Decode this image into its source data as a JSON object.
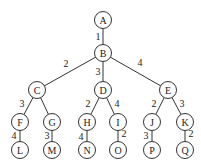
{
  "diagram": {
    "type": "weighted-tree",
    "nodes": [
      {
        "id": "A",
        "label": "A",
        "x": 103,
        "y": 20
      },
      {
        "id": "B",
        "label": "B",
        "x": 103,
        "y": 53
      },
      {
        "id": "C",
        "label": "C",
        "x": 37,
        "y": 90
      },
      {
        "id": "D",
        "label": "D",
        "x": 103,
        "y": 90
      },
      {
        "id": "E",
        "label": "E",
        "x": 168,
        "y": 90
      },
      {
        "id": "F",
        "label": "F",
        "x": 20,
        "y": 122
      },
      {
        "id": "G",
        "label": "G",
        "x": 52,
        "y": 122
      },
      {
        "id": "H",
        "label": "H",
        "x": 87,
        "y": 122
      },
      {
        "id": "I",
        "label": "I",
        "x": 118,
        "y": 122
      },
      {
        "id": "J",
        "label": "J",
        "x": 152,
        "y": 122
      },
      {
        "id": "K",
        "label": "K",
        "x": 185,
        "y": 122
      },
      {
        "id": "L",
        "label": "L",
        "x": 20,
        "y": 150
      },
      {
        "id": "M",
        "label": "M",
        "x": 52,
        "y": 150
      },
      {
        "id": "N",
        "label": "N",
        "x": 87,
        "y": 150
      },
      {
        "id": "O",
        "label": "O",
        "x": 118,
        "y": 150
      },
      {
        "id": "P",
        "label": "P",
        "x": 152,
        "y": 150
      },
      {
        "id": "Q",
        "label": "Q",
        "x": 185,
        "y": 150
      }
    ],
    "edges": [
      {
        "from": "A",
        "to": "B",
        "weight": "1",
        "lx": 98,
        "ly": 36
      },
      {
        "from": "B",
        "to": "C",
        "weight": "2",
        "lx": 66,
        "ly": 63
      },
      {
        "from": "B",
        "to": "D",
        "weight": "3",
        "lx": 98,
        "ly": 71
      },
      {
        "from": "B",
        "to": "E",
        "weight": "4",
        "lx": 140,
        "ly": 62
      },
      {
        "from": "C",
        "to": "F",
        "weight": "3",
        "lx": 22,
        "ly": 103
      },
      {
        "from": "C",
        "to": "G",
        "weight": "",
        "lx": 0,
        "ly": 0
      },
      {
        "from": "D",
        "to": "H",
        "weight": "2",
        "lx": 88,
        "ly": 103
      },
      {
        "from": "D",
        "to": "I",
        "weight": "4",
        "lx": 117,
        "ly": 103
      },
      {
        "from": "E",
        "to": "J",
        "weight": "2",
        "lx": 154,
        "ly": 103
      },
      {
        "from": "E",
        "to": "K",
        "weight": "3",
        "lx": 182,
        "ly": 103
      },
      {
        "from": "F",
        "to": "L",
        "weight": "4",
        "lx": 14,
        "ly": 135
      },
      {
        "from": "G",
        "to": "M",
        "weight": "3",
        "lx": 47,
        "ly": 135
      },
      {
        "from": "H",
        "to": "N",
        "weight": "4",
        "lx": 81,
        "ly": 136
      },
      {
        "from": "I",
        "to": "O",
        "weight": "2",
        "lx": 124,
        "ly": 133
      },
      {
        "from": "J",
        "to": "P",
        "weight": "3",
        "lx": 146,
        "ly": 135
      },
      {
        "from": "K",
        "to": "Q",
        "weight": "2",
        "lx": 191,
        "ly": 133
      }
    ],
    "node_radius": 8.5
  }
}
